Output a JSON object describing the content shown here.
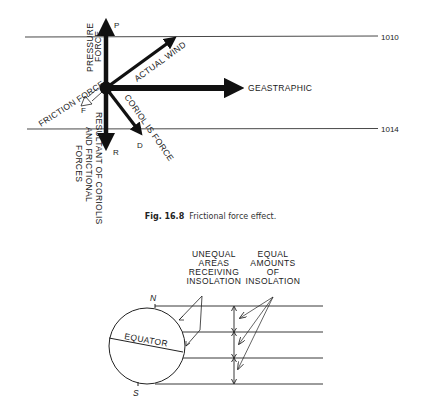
{
  "figure1": {
    "isobars": [
      {
        "label": "1010"
      },
      {
        "label": "1014"
      }
    ],
    "vectors": {
      "pressure": {
        "letter": "P",
        "label_line1": "PRESSURE",
        "label_line2": "FORCE"
      },
      "actual_wind": {
        "label": "ACTUAL WIND"
      },
      "geostrophic": {
        "label": "GEASTRAPHIC"
      },
      "friction": {
        "letter": "F",
        "label": "FRICTION FORCE"
      },
      "coriolis": {
        "letter": "D",
        "label": "CORIOL IS FORCE"
      },
      "resultant": {
        "letter": "R",
        "label_line1": "RESULTANT OF CORIOLIS",
        "label_line2": "AND FRICTIONAL",
        "label_line3": "FORCES"
      }
    },
    "caption": {
      "number": "Fig. 16.8",
      "text": "Frictional force effect."
    }
  },
  "figure2": {
    "globe": {
      "north": "N",
      "south": "S",
      "equator": "EQUATOR"
    },
    "unequal_label": [
      "UNEQUAL",
      "AREAS",
      "RECEIVING",
      "INSOLATION"
    ],
    "equal_label": [
      "EQUAL",
      "AMOUNTS",
      "OF",
      "INSOLATION"
    ]
  }
}
